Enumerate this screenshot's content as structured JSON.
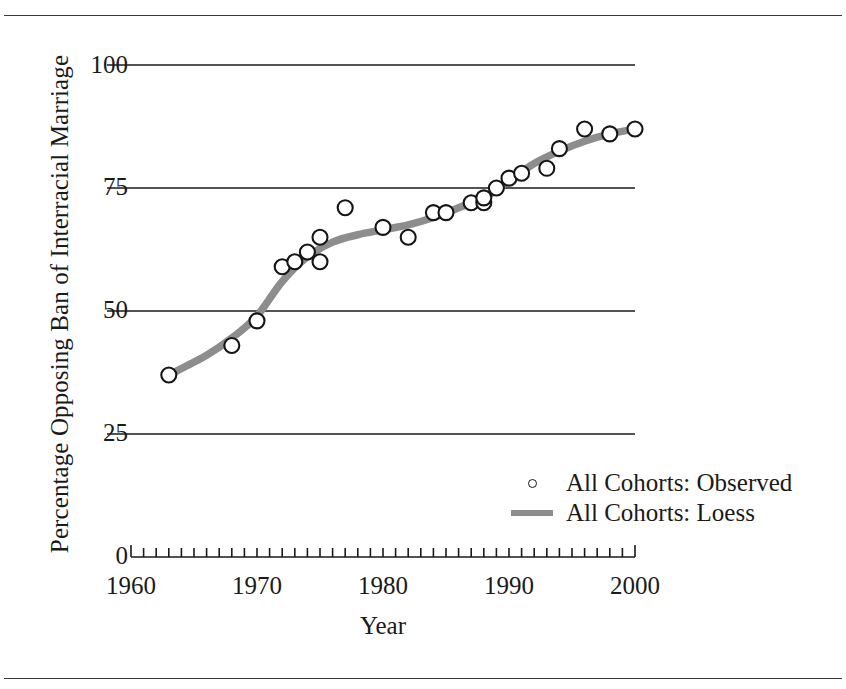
{
  "chart_data": {
    "type": "scatter",
    "title": "",
    "xlabel": "Year",
    "ylabel": "Percentage Opposing Ban of Interracial Marriage",
    "xlim": [
      1960,
      2000
    ],
    "ylim": [
      0,
      100
    ],
    "xticks": [
      1960,
      1970,
      1980,
      1990,
      2000
    ],
    "yticks": [
      0,
      25,
      50,
      75,
      100
    ],
    "xtick_labels": [
      "1960",
      "1970",
      "1980",
      "1990",
      "2000"
    ],
    "ytick_labels": [
      "0",
      "25",
      "50",
      "75",
      "100"
    ],
    "minor_xtick_interval": 1,
    "grid": "horizontal",
    "legend_position": "lower right",
    "series": [
      {
        "name": "All Cohorts: Observed",
        "marker": "open-circle",
        "color": "#151515",
        "x": [
          1963,
          1968,
          1970,
          1972,
          1973,
          1974,
          1975,
          1975,
          1977,
          1980,
          1982,
          1984,
          1985,
          1987,
          1988,
          1988,
          1989,
          1990,
          1991,
          1993,
          1994,
          1996,
          1998,
          2000
        ],
        "y": [
          37,
          43,
          48,
          59,
          60,
          62,
          65,
          60,
          71,
          67,
          65,
          70,
          70,
          72,
          72,
          73,
          75,
          77,
          78,
          79,
          83,
          87,
          86,
          87
        ]
      },
      {
        "name": "All Cohorts: Loess",
        "marker": "thick-line",
        "color": "#8d8d8d",
        "x": [
          1963,
          1966,
          1968,
          1970,
          1972,
          1974,
          1976,
          1978,
          1980,
          1982,
          1984,
          1986,
          1988,
          1990,
          1992,
          1994,
          1996,
          1998,
          2000
        ],
        "y": [
          37,
          41,
          44.5,
          49,
          56,
          61,
          64,
          65.5,
          66.5,
          67.5,
          69,
          71,
          73,
          76.5,
          80,
          82.5,
          84.5,
          86,
          87
        ]
      }
    ]
  },
  "legend": {
    "entries": [
      {
        "label": "All Cohorts: Observed",
        "key": "open-circle"
      },
      {
        "label": "All Cohorts: Loess",
        "key": "thick-line"
      }
    ]
  },
  "colors": {
    "loess_line": "#8d8d8d",
    "marker_stroke": "#151515",
    "axis": "#1a1a1a",
    "gridline": "#1a1a1a"
  }
}
